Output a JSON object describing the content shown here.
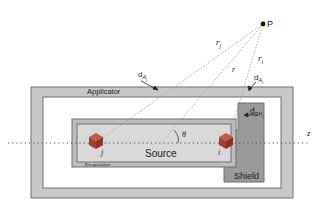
{
  "diagram": {
    "title": "",
    "labels": {
      "applicator": "Applicator",
      "source": "Source",
      "shield": "Shield",
      "encapsulation": "Encapsulation",
      "point": "P",
      "axis": "z",
      "theta": "θ",
      "r": "r",
      "r_j": "r",
      "r_j_sub": "j",
      "r_i": "r",
      "r_i_sub": "i",
      "d_Aj": "d",
      "d_Aj_sub": "A",
      "d_Aj_subsub": "j",
      "d_Ai": "d",
      "d_Ai_sub": "A",
      "d_Ai_subsub": "i",
      "d_SHi": "d",
      "d_SHi_sub": "SH",
      "d_SHi_subsub": "i",
      "cube_j": "j",
      "cube_i": "i"
    },
    "colors": {
      "applicator_fill": "#c8c8c8",
      "applicator_border": "#6e6e6e",
      "encapsulation_fill": "#bdbdbd",
      "source_fill": "#d9d9d9",
      "shield_fill": "#9a9a9a",
      "cube_color": "#b24a3a",
      "line_color": "#9a9a9a",
      "text_color": "#222222"
    }
  }
}
